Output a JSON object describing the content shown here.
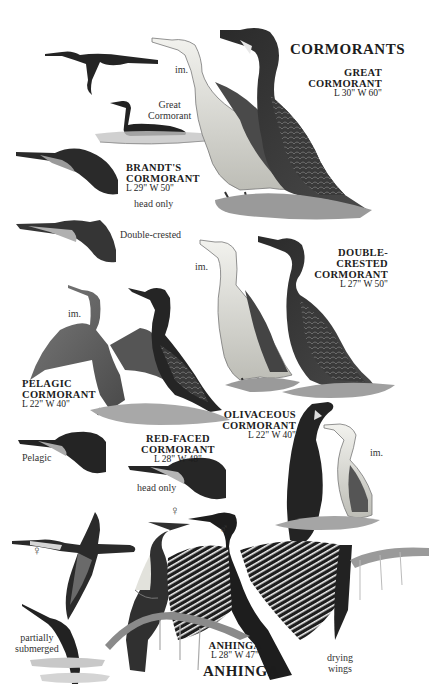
{
  "page": {
    "section_title": "CORMORANTS",
    "footer_title": "ANHINGA"
  },
  "labels": {
    "great_cormorant": {
      "name_line1": "GREAT",
      "name_line2": "CORMORANT",
      "measure": "L 30\" W 60\""
    },
    "great_im": "im.",
    "great_swimming": {
      "line1": "Great",
      "line2": "Cormorant"
    },
    "brandts": {
      "name_line1": "BRANDT'S",
      "name_line2": "CORMORANT",
      "measure": "L 29\" W 50\"",
      "note": "head only"
    },
    "double_crested_head": "Double-crested",
    "double_crested": {
      "name_line1": "DOUBLE-",
      "name_line2": "CRESTED",
      "name_line3": "CORMORANT",
      "measure": "L 27\" W 50\""
    },
    "double_crested_im": "im.",
    "pelagic": {
      "name_line1": "PELAGIC",
      "name_line2": "CORMORANT",
      "measure": "L 22\" W 40\""
    },
    "pelagic_im": "im.",
    "pelagic_head": "Pelagic",
    "red_faced": {
      "name": "RED-FACED CORMORANT",
      "measure": "L 28\" W 48\"",
      "note": "head only"
    },
    "olivaceous": {
      "name_line1": "OLIVACEOUS",
      "name_line2": "CORMORANT",
      "measure": "L 22\" W 40\""
    },
    "olivaceous_im": "im.",
    "anhinga": {
      "name": "ANHINGA",
      "measure": "L 28\" W 47\""
    },
    "female_flying": "♀",
    "female_perched": "♀",
    "male_perched": "♂",
    "partially_submerged": {
      "line1": "partially",
      "line2": "submerged"
    },
    "drying_wings": {
      "line1": "drying",
      "line2": "wings"
    }
  },
  "colors": {
    "ink_dark": "#1e1e1e",
    "ink_mid": "#5a5a5a",
    "ink_light": "#b8b8b8",
    "pale_breast": "#e6e6e0",
    "background": "#ffffff"
  }
}
